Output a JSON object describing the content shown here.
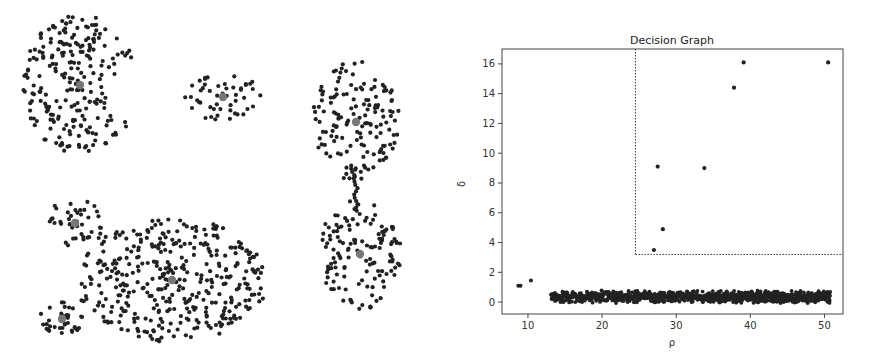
{
  "left_panel": {
    "description": "Clustered scatter of 2D points with cluster centers highlighted",
    "point_color": "#222222",
    "center_color": "#777777",
    "clusters": [
      {
        "name": "crescent",
        "center": [
          80,
          85
        ],
        "shape": "crescent",
        "rx": 58,
        "ry": 70,
        "count": 230
      },
      {
        "name": "small-right-top",
        "center": [
          223,
          97
        ],
        "shape": "ellipse",
        "rx": 38,
        "ry": 24,
        "count": 50
      },
      {
        "name": "top-right-oval",
        "center": [
          356,
          122
        ],
        "shape": "ellipse",
        "rx": 44,
        "ry": 62,
        "count": 150
      },
      {
        "name": "bottom-right-oval",
        "center": [
          360,
          254
        ],
        "shape": "ellipse",
        "rx": 42,
        "ry": 56,
        "count": 130
      },
      {
        "name": "small-left-mid",
        "center": [
          75,
          223
        ],
        "shape": "ellipse",
        "rx": 30,
        "ry": 24,
        "count": 40
      },
      {
        "name": "large-blob",
        "center": [
          172,
          280
        ],
        "shape": "ellipse",
        "rx": 96,
        "ry": 62,
        "count": 380
      },
      {
        "name": "small-left-bottom",
        "center": [
          62,
          319
        ],
        "shape": "ellipse",
        "rx": 22,
        "ry": 18,
        "count": 35
      }
    ],
    "bridges": [
      {
        "from": [
          354,
          172
        ],
        "to": [
          358,
          214
        ],
        "count": 14
      },
      {
        "from": [
          92,
          232
        ],
        "to": [
          104,
          244
        ],
        "count": 3
      }
    ]
  },
  "chart_data": {
    "type": "scatter",
    "title": "Decision Graph",
    "xlabel": "ρ",
    "ylabel": "δ",
    "xlim": [
      6.5,
      52.5
    ],
    "ylim": [
      -0.8,
      17.0
    ],
    "xticks": [
      10,
      20,
      30,
      40,
      50
    ],
    "yticks": [
      0,
      2,
      4,
      6,
      8,
      10,
      12,
      14,
      16
    ],
    "grid": false,
    "legend": null,
    "threshold": {
      "rho_min": 24.5,
      "delta_min": 3.2,
      "style": "dotted"
    },
    "outlier_points": [
      {
        "x": 8.7,
        "y": 1.1
      },
      {
        "x": 9.0,
        "y": 1.1
      },
      {
        "x": 10.4,
        "y": 1.45
      }
    ],
    "cluster_center_points": [
      {
        "x": 27.0,
        "y": 3.5
      },
      {
        "x": 28.2,
        "y": 4.9
      },
      {
        "x": 27.5,
        "y": 9.1
      },
      {
        "x": 33.8,
        "y": 9.0
      },
      {
        "x": 37.8,
        "y": 14.4
      },
      {
        "x": 39.1,
        "y": 16.1
      },
      {
        "x": 50.5,
        "y": 16.1
      }
    ],
    "dense_band": {
      "x_range": [
        13.0,
        50.8
      ],
      "y_range": [
        0.1,
        1.1
      ],
      "approx_count": 1000,
      "note": "dense band of non-center points near δ≈0.2–1.0"
    },
    "point_color": "#222222"
  }
}
